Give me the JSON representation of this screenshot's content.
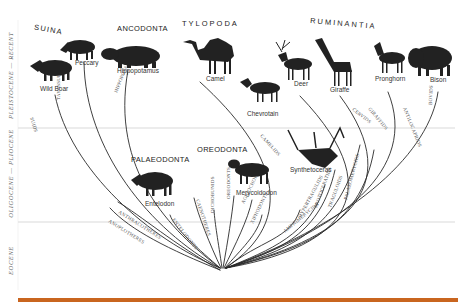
{
  "colors": {
    "ink": "#2a2a2a",
    "bar": "#c9651f",
    "divider": "#cfcfcf",
    "branchLabel": "#555555"
  },
  "eras": [
    {
      "label": "PLEISTOCENE — RECENT"
    },
    {
      "label": "OLIGOCENE — PLIOCENE"
    },
    {
      "label": "EOCENE"
    }
  ],
  "groups": {
    "suina": "SUINA",
    "ancodonta": "ANCODONTA",
    "tylopoda": "TYLOPODA",
    "ruminantia": "RUMINANTIA",
    "palaeodonta": "PALAEODONTA",
    "oreodonta": "OREODONTA"
  },
  "animals": {
    "wild_boar": "Wild Boar",
    "peccary": "Peccary",
    "hippopotamus": "Hippopotamus",
    "camel": "Camel",
    "chevrotain": "Chevrotain",
    "deer": "Deer",
    "giraffe": "Giraffe",
    "pronghorn": "Pronghorn",
    "bison": "Bison",
    "entelodon": "Entelodon",
    "merycoidodon": "Merycoidodon",
    "synthetoceras": "Synthetoceras"
  },
  "branches": [
    {
      "id": "suids",
      "label": "SUIDS"
    },
    {
      "id": "tayassuids",
      "label": "TAYASSUIDS"
    },
    {
      "id": "hippopotamids",
      "label": "HIPPOPOTAMIDS"
    },
    {
      "id": "anoplotheres",
      "label": "ANOPLOTHERES"
    },
    {
      "id": "anthracotheres",
      "label": "ANTHRACOTHERES"
    },
    {
      "id": "entelodonts",
      "label": "ENTELODONTS"
    },
    {
      "id": "caenotheres",
      "label": "CAENOTHERES"
    },
    {
      "id": "dichobunids",
      "label": "DICHOBUNIDS"
    },
    {
      "id": "oreodonts",
      "label": "OREODONTS"
    },
    {
      "id": "agriochoeres",
      "label": "AGRIOCHOERES"
    },
    {
      "id": "xiphodonts",
      "label": "XIPHODONTS"
    },
    {
      "id": "camelids",
      "label": "CAMELIDS"
    },
    {
      "id": "amphimerycids",
      "label": "AMPHIMERYCIDS"
    },
    {
      "id": "hypertragulids",
      "label": "HYPERTRAGULIDS"
    },
    {
      "id": "protoceratids",
      "label": "PROTOCERATIDS"
    },
    {
      "id": "traguloids",
      "label": "TRAGULOIDS"
    },
    {
      "id": "palaeomerycids",
      "label": "PALAEOMERYCIDS"
    },
    {
      "id": "cervids",
      "label": "CERVIDS"
    },
    {
      "id": "giraffids",
      "label": "GIRAFFIDS"
    },
    {
      "id": "antilocaprids",
      "label": "ANTILOCAPRIDS"
    },
    {
      "id": "bovids",
      "label": "BOVIDS"
    }
  ]
}
